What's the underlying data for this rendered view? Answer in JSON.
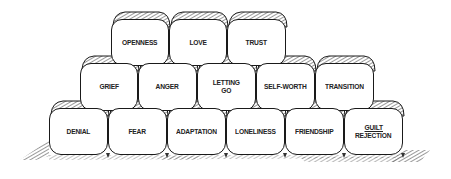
{
  "diagram": {
    "type": "stacked-blocks-wall",
    "rows": [
      {
        "name": "top",
        "blocks": [
          {
            "lines": [
              "OPENNESS"
            ],
            "x": 111,
            "y": 19,
            "w": 58,
            "h": 47
          },
          {
            "lines": [
              "LOVE"
            ],
            "x": 169,
            "y": 19,
            "w": 58,
            "h": 47
          },
          {
            "lines": [
              "TRUST"
            ],
            "x": 227,
            "y": 19,
            "w": 59,
            "h": 47
          }
        ]
      },
      {
        "name": "middle",
        "blocks": [
          {
            "lines": [
              "GRIEF"
            ],
            "x": 80,
            "y": 63,
            "w": 58,
            "h": 48
          },
          {
            "lines": [
              "ANGER"
            ],
            "x": 138,
            "y": 63,
            "w": 59,
            "h": 48
          },
          {
            "lines": [
              "LETTING",
              "GO"
            ],
            "x": 197,
            "y": 63,
            "w": 59,
            "h": 48
          },
          {
            "lines": [
              "SELF-WORTH"
            ],
            "x": 256,
            "y": 63,
            "w": 59,
            "h": 48
          },
          {
            "lines": [
              "TRANSITION"
            ],
            "x": 315,
            "y": 63,
            "w": 59,
            "h": 48
          }
        ]
      },
      {
        "name": "bottom",
        "blocks": [
          {
            "lines": [
              "DENIAL"
            ],
            "x": 49,
            "y": 108,
            "w": 59,
            "h": 47
          },
          {
            "lines": [
              "FEAR"
            ],
            "x": 108,
            "y": 108,
            "w": 59,
            "h": 47
          },
          {
            "lines": [
              "ADAPTATION"
            ],
            "x": 167,
            "y": 108,
            "w": 59,
            "h": 47
          },
          {
            "lines": [
              "LONELINESS"
            ],
            "x": 226,
            "y": 108,
            "w": 59,
            "h": 47
          },
          {
            "lines": [
              "FRIENDSHIP"
            ],
            "x": 285,
            "y": 108,
            "w": 59,
            "h": 47
          },
          {
            "lines": [
              "GUILT",
              "REJECTION"
            ],
            "underline_first": true,
            "x": 344,
            "y": 108,
            "w": 59,
            "h": 47
          }
        ]
      }
    ],
    "colors": {
      "ink": "#1a1a1a",
      "paper": "#ffffff",
      "hatch": "#333333"
    }
  }
}
